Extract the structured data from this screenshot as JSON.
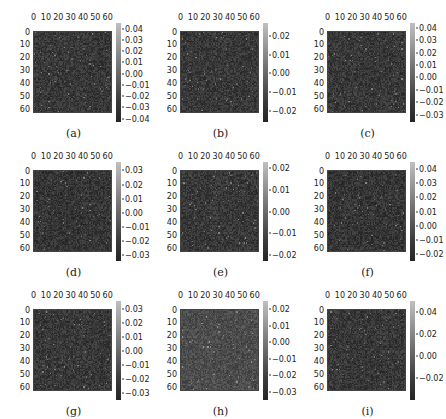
{
  "chart_data": [
    {
      "type": "heatmap",
      "label": "(a)",
      "xticks": [
        0,
        10,
        20,
        30,
        40,
        50,
        60
      ],
      "yticks": [
        0,
        10,
        20,
        30,
        40,
        50,
        60
      ],
      "shape": [
        64,
        64
      ],
      "colorbar_ticks": [
        0.04,
        0.03,
        0.02,
        0.01,
        0.0,
        -0.01,
        -0.02,
        -0.03,
        -0.04
      ],
      "vmin": -0.043,
      "vmax": 0.045,
      "cmap": "gray",
      "brightness": 0.22
    },
    {
      "type": "heatmap",
      "label": "(b)",
      "xticks": [
        0,
        10,
        20,
        30,
        40,
        50,
        60
      ],
      "yticks": [
        0,
        10,
        20,
        30,
        40,
        50,
        60
      ],
      "shape": [
        64,
        64
      ],
      "colorbar_ticks": [
        0.02,
        0.01,
        0.0,
        -0.01,
        -0.02
      ],
      "vmin": -0.026,
      "vmax": 0.027,
      "cmap": "gray",
      "brightness": 0.22
    },
    {
      "type": "heatmap",
      "label": "(c)",
      "xticks": [
        0,
        10,
        20,
        30,
        40,
        50,
        60
      ],
      "yticks": [
        0,
        10,
        20,
        30,
        40,
        50,
        60
      ],
      "shape": [
        64,
        64
      ],
      "colorbar_ticks": [
        0.04,
        0.03,
        0.02,
        0.01,
        0.0,
        -0.01,
        -0.02,
        -0.03
      ],
      "vmin": -0.036,
      "vmax": 0.044,
      "cmap": "gray",
      "brightness": 0.22
    },
    {
      "type": "heatmap",
      "label": "(d)",
      "xticks": [
        0,
        10,
        20,
        30,
        40,
        50,
        60
      ],
      "yticks": [
        0,
        10,
        20,
        30,
        40,
        50,
        60
      ],
      "shape": [
        64,
        64
      ],
      "colorbar_ticks": [
        0.03,
        0.02,
        0.01,
        0.0,
        -0.01,
        -0.02,
        -0.03
      ],
      "vmin": -0.034,
      "vmax": 0.036,
      "cmap": "gray",
      "brightness": 0.21
    },
    {
      "type": "heatmap",
      "label": "(e)",
      "xticks": [
        0,
        10,
        20,
        30,
        40,
        50,
        60
      ],
      "yticks": [
        0,
        10,
        20,
        30,
        40,
        50,
        60
      ],
      "shape": [
        64,
        64
      ],
      "colorbar_ticks": [
        0.02,
        0.01,
        0.0,
        -0.01,
        -0.02
      ],
      "vmin": -0.023,
      "vmax": 0.023,
      "cmap": "gray",
      "brightness": 0.22
    },
    {
      "type": "heatmap",
      "label": "(f)",
      "xticks": [
        0,
        10,
        20,
        30,
        40,
        50,
        60
      ],
      "yticks": [
        0,
        10,
        20,
        30,
        40,
        50,
        60
      ],
      "shape": [
        64,
        64
      ],
      "colorbar_ticks": [
        0.04,
        0.03,
        0.02,
        0.01,
        0.0,
        -0.01,
        -0.02
      ],
      "vmin": -0.025,
      "vmax": 0.045,
      "cmap": "gray",
      "brightness": 0.21
    },
    {
      "type": "heatmap",
      "label": "(g)",
      "xticks": [
        0,
        10,
        20,
        30,
        40,
        50,
        60
      ],
      "yticks": [
        0,
        10,
        20,
        30,
        40,
        50,
        60
      ],
      "shape": [
        64,
        64
      ],
      "colorbar_ticks": [
        0.03,
        0.02,
        0.01,
        0.0,
        -0.01,
        -0.02,
        -0.03
      ],
      "vmin": -0.035,
      "vmax": 0.036,
      "cmap": "gray",
      "brightness": 0.22
    },
    {
      "type": "heatmap",
      "label": "(h)",
      "xticks": [
        0,
        10,
        20,
        30,
        40,
        50,
        60
      ],
      "yticks": [
        0,
        10,
        20,
        30,
        40,
        50,
        60
      ],
      "shape": [
        64,
        64
      ],
      "colorbar_ticks": [
        0.02,
        0.01,
        0.0,
        -0.01,
        -0.02,
        -0.03
      ],
      "vmin": -0.035,
      "vmax": 0.025,
      "cmap": "gray",
      "brightness": 0.3
    },
    {
      "type": "heatmap",
      "label": "(i)",
      "xticks": [
        0,
        10,
        20,
        30,
        40,
        50,
        60
      ],
      "yticks": [
        0,
        10,
        20,
        30,
        40,
        50,
        60
      ],
      "shape": [
        64,
        64
      ],
      "colorbar_ticks": [
        0.04,
        0.02,
        0.0,
        -0.02
      ],
      "vmin": -0.04,
      "vmax": 0.05,
      "cmap": "gray",
      "brightness": 0.22
    }
  ],
  "layout": {
    "columns": [
      0,
      147,
      294
    ],
    "rows": [
      0,
      139,
      278
    ]
  }
}
